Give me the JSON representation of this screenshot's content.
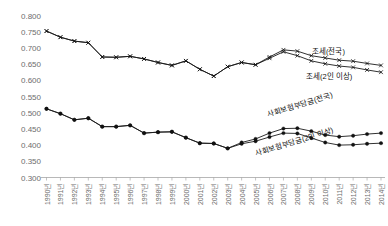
{
  "chart_data": {
    "type": "line",
    "title": "",
    "subtitle": "",
    "xlabel": "",
    "ylabel": "",
    "ylim": [
      0.3,
      0.8
    ],
    "ytick_step": 0.05,
    "grid": false,
    "legend_position": "inline-annotations",
    "categories": [
      "1990년",
      "1991년",
      "1992년",
      "1993년",
      "1994년",
      "1995년",
      "1996년",
      "1997년",
      "1998년",
      "1999년",
      "2000년",
      "2001년",
      "2002년",
      "2003년",
      "2004년",
      "2005년",
      "2006년",
      "2007년",
      "2008년",
      "2009년",
      "2010년",
      "2011년",
      "2012년",
      "2013년",
      "2014년"
    ],
    "ytick_labels": [
      "0.300",
      "0.350",
      "0.400",
      "0.450",
      "0.500",
      "0.550",
      "0.600",
      "0.650",
      "0.700",
      "0.750",
      "0.800"
    ],
    "series": [
      {
        "name": "조세(전국)",
        "marker": "x",
        "annotation": "조세(전국)",
        "values": [
          0.752,
          0.733,
          0.721,
          0.716,
          0.672,
          0.671,
          0.674,
          0.666,
          0.655,
          0.646,
          0.66,
          0.634,
          0.613,
          0.642,
          0.655,
          0.648,
          0.672,
          0.694,
          0.69,
          0.676,
          0.669,
          0.662,
          0.659,
          0.652,
          0.646
        ]
      },
      {
        "name": "조세(2인 이상)",
        "marker": "x",
        "annotation": "조세(2인 이상)",
        "values": [
          0.752,
          0.733,
          0.721,
          0.716,
          0.672,
          0.671,
          0.674,
          0.666,
          0.655,
          0.646,
          0.66,
          0.634,
          0.613,
          0.642,
          0.655,
          0.648,
          0.668,
          0.688,
          0.676,
          0.66,
          0.651,
          0.644,
          0.64,
          0.632,
          0.625
        ]
      },
      {
        "name": "사회보험부담금(전국)",
        "marker": "dot",
        "annotation": "사회보험부담금(전국)",
        "values": [
          0.512,
          0.497,
          0.478,
          0.483,
          0.457,
          0.457,
          0.461,
          0.437,
          0.44,
          0.441,
          0.423,
          0.406,
          0.405,
          0.39,
          0.408,
          0.419,
          0.437,
          0.451,
          0.452,
          0.443,
          0.431,
          0.426,
          0.429,
          0.434,
          0.437
        ]
      },
      {
        "name": "사회보험부담금(2인 이상)",
        "marker": "dot",
        "annotation": "사회보험부담금(2인 이상)",
        "values": [
          0.512,
          0.497,
          0.478,
          0.483,
          0.457,
          0.457,
          0.461,
          0.437,
          0.44,
          0.441,
          0.423,
          0.406,
          0.405,
          0.39,
          0.404,
          0.412,
          0.425,
          0.437,
          0.436,
          0.422,
          0.408,
          0.4,
          0.401,
          0.404,
          0.406
        ]
      }
    ]
  }
}
